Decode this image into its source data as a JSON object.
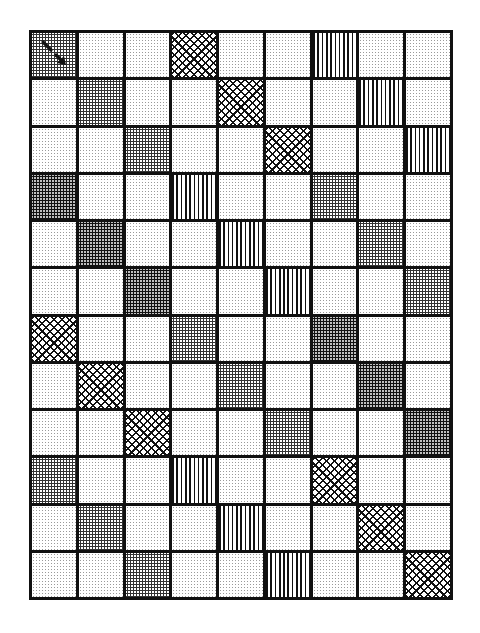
{
  "grid": {
    "columns": 9,
    "rows": 12,
    "legend": {
      "L": "light-dots",
      "M": "medium-dots",
      "D": "dark-dots",
      "X": "crosshatch",
      "V": "vertical-stripes"
    },
    "colors": {
      "line": "#111111",
      "background": "#ffffff"
    },
    "cells": [
      [
        "M",
        "L",
        "L",
        "X",
        "L",
        "L",
        "V",
        "L",
        "L"
      ],
      [
        "L",
        "M",
        "L",
        "L",
        "X",
        "L",
        "L",
        "V",
        "L"
      ],
      [
        "L",
        "L",
        "M",
        "L",
        "L",
        "X",
        "L",
        "L",
        "V"
      ],
      [
        "D",
        "L",
        "L",
        "V",
        "L",
        "L",
        "M",
        "L",
        "L"
      ],
      [
        "L",
        "D",
        "L",
        "L",
        "V",
        "L",
        "L",
        "M",
        "L"
      ],
      [
        "L",
        "L",
        "D",
        "L",
        "L",
        "V",
        "L",
        "L",
        "M"
      ],
      [
        "X",
        "L",
        "L",
        "M",
        "L",
        "L",
        "D",
        "L",
        "L"
      ],
      [
        "L",
        "X",
        "L",
        "L",
        "M",
        "L",
        "L",
        "D",
        "L"
      ],
      [
        "L",
        "L",
        "X",
        "L",
        "L",
        "M",
        "L",
        "L",
        "D"
      ],
      [
        "M",
        "L",
        "L",
        "V",
        "L",
        "L",
        "X",
        "L",
        "L"
      ],
      [
        "L",
        "M",
        "L",
        "L",
        "V",
        "L",
        "L",
        "X",
        "L"
      ],
      [
        "L",
        "L",
        "M",
        "L",
        "L",
        "V",
        "L",
        "L",
        "X"
      ]
    ],
    "marker": {
      "row": 0,
      "col": 0,
      "icon": "diagonal-arrow-down-right-icon"
    }
  }
}
